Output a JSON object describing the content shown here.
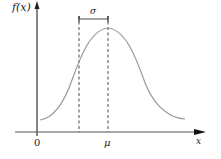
{
  "diagram": {
    "y_axis_label": "f(x)",
    "x_axis_label": "x",
    "origin_label": "0",
    "mean_label": "μ",
    "spread_label": "σ",
    "colors": {
      "axis": "#222222",
      "curve": "#9a9a9a",
      "dashed": "#333333"
    }
  }
}
